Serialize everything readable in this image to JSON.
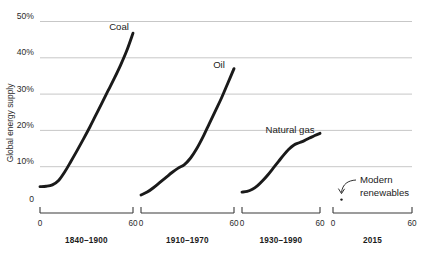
{
  "chart_data": {
    "type": "line",
    "title": "",
    "subtitle": "",
    "xlabel": "",
    "ylabel": "Global energy supply",
    "ylim": [
      0,
      52
    ],
    "yticks": [
      "0",
      "10%",
      "20%",
      "30%",
      "40%",
      "50%"
    ],
    "ytick_values": [
      0,
      10,
      20,
      30,
      40,
      50
    ],
    "grid": true,
    "legend_position": "inline-labels",
    "xlim": [
      0,
      60
    ],
    "xticks": [
      "0",
      "60"
    ],
    "xtick_values": [
      0,
      60
    ],
    "panels": [
      {
        "name": "coal-panel",
        "label": "1840–1900",
        "series_label": "Coal",
        "x": [
          0,
          4,
          8,
          12,
          16,
          20,
          24,
          28,
          32,
          36,
          40,
          44,
          48,
          52,
          56,
          60
        ],
        "y": [
          4.5,
          4.6,
          5.0,
          6.2,
          8.6,
          11.5,
          14.5,
          17.6,
          20.8,
          24.2,
          27.6,
          31.0,
          34.4,
          38.0,
          42.0,
          46.8
        ]
      },
      {
        "name": "oil-panel",
        "label": "1910–1970",
        "series_label": "Oil",
        "x": [
          0,
          4,
          8,
          12,
          16,
          20,
          24,
          28,
          32,
          36,
          40,
          44,
          48,
          52,
          56,
          60
        ],
        "y": [
          2.2,
          3.0,
          4.2,
          5.6,
          7.0,
          8.4,
          9.6,
          10.6,
          12.4,
          15.0,
          18.2,
          21.8,
          25.4,
          29.0,
          33.0,
          37.0
        ]
      },
      {
        "name": "natural-gas-panel",
        "label": "1930–1990",
        "series_label": "Natural gas",
        "x": [
          0,
          4,
          8,
          12,
          16,
          20,
          24,
          28,
          32,
          36,
          40,
          44,
          48,
          52,
          56,
          60
        ],
        "y": [
          3.0,
          3.2,
          3.8,
          4.8,
          6.2,
          7.8,
          9.6,
          11.4,
          13.2,
          14.8,
          16.0,
          16.6,
          17.2,
          17.9,
          18.6,
          19.2
        ]
      },
      {
        "name": "renewables-panel",
        "label": "2015",
        "series_label": "",
        "x": [],
        "y": []
      }
    ],
    "annotations": [
      {
        "name": "modern-renewables",
        "line1": "Modern",
        "line2": "renewables",
        "point_value": 1.2,
        "panel": "renewables-panel"
      }
    ]
  }
}
